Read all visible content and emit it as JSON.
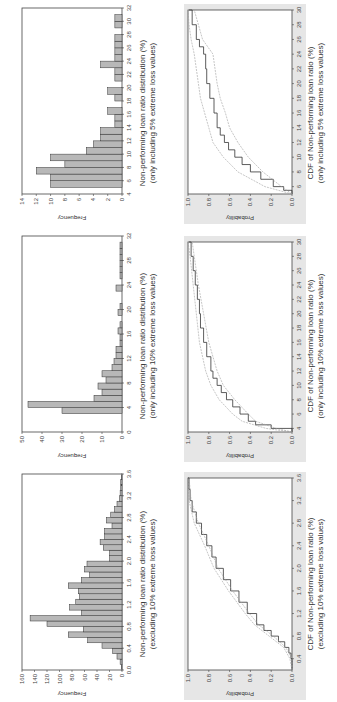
{
  "figure": {
    "orientation": "rotated 90 degrees counter-clockwise",
    "colors": {
      "bar_fill": "#b8b8b8",
      "bar_stroke": "#333333",
      "cdf_bg": "#e6e6e6",
      "cdf_line": "#333333",
      "cdf_band": "#a0a0a0"
    }
  },
  "panels": {
    "hist_excl10": {
      "ylabel": "Frequency",
      "caption_line1": "Non-performing loan ratio distribution (%)",
      "caption_line2": "(excluding 10% extreme loss values)"
    },
    "hist_only10": {
      "ylabel": "Frequency",
      "caption_line1": "Non-performing loan ratio distribution (%)",
      "caption_line2": "(only including 10% extreme loss values)"
    },
    "hist_only5": {
      "ylabel": "Frequency",
      "caption_line1": "Non-performing loan ratio distribution (%)",
      "caption_line2": "(only including 5% extreme loss values)"
    },
    "cdf_excl10": {
      "ylabel": "Probability",
      "caption_line1": "CDF of Non-performing loan ratio (%)",
      "caption_line2": "(excluding 10% extreme loss values)"
    },
    "cdf_only10": {
      "ylabel": "Probability",
      "caption_line1": "CDF of Non-performing loan ratio (%)",
      "caption_line2": "(only including 10% extreme loss values)"
    },
    "cdf_only5": {
      "ylabel": "Probability",
      "caption_line1": "CDF of Non-performing loan ratio (%)",
      "caption_line2": "(only including 5% extreme loss values)"
    }
  },
  "chart_data": [
    {
      "id": "hist_excl10",
      "type": "bar",
      "title": "Non-performing loan ratio distribution (%) (excluding 10% extreme loss values)",
      "xlabel": "Non-performing loan ratio (%)",
      "ylabel": "Frequency",
      "xlim": [
        0.0,
        3.6
      ],
      "ylim": [
        0,
        160
      ],
      "xticks": [
        0.0,
        0.4,
        0.8,
        1.2,
        1.6,
        2.0,
        2.4,
        2.8,
        3.2,
        3.6
      ],
      "yticks": [
        0,
        20,
        40,
        60,
        80,
        100,
        120,
        140,
        160
      ],
      "bin_width": 0.1,
      "bin_start": 0.0,
      "values": [
        1,
        3,
        8,
        15,
        32,
        55,
        86,
        62,
        120,
        147,
        65,
        84,
        74,
        68,
        70,
        86,
        65,
        52,
        60,
        56,
        20,
        20,
        30,
        35,
        28,
        28,
        16,
        25,
        18,
        12,
        8,
        4,
        3,
        2,
        2,
        1
      ],
      "grid": false
    },
    {
      "id": "hist_only10",
      "type": "bar",
      "title": "Non-performing loan ratio distribution (%) (only including 10% extreme loss values)",
      "xlabel": "Non-performing loan ratio (%)",
      "ylabel": "Frequency",
      "xlim": [
        0,
        32
      ],
      "ylim": [
        0,
        50
      ],
      "xticks": [
        0,
        4,
        8,
        12,
        16,
        20,
        24,
        28,
        32
      ],
      "yticks": [
        0,
        10,
        20,
        30,
        40,
        50
      ],
      "bin_width": 1,
      "bin_start": 3,
      "values": [
        30,
        47,
        14,
        10,
        12,
        8,
        10,
        5,
        4,
        3,
        3,
        1,
        1,
        2,
        1,
        0,
        2,
        1,
        0,
        0,
        3,
        0,
        1,
        1,
        1,
        1,
        1,
        1
      ],
      "grid": false
    },
    {
      "id": "hist_only5",
      "type": "bar",
      "title": "Non-performing loan ratio distribution (%) (only including 5% extreme loss values)",
      "xlabel": "Non-performing loan ratio (%)",
      "ylabel": "Frequency",
      "xlim": [
        4,
        32
      ],
      "ylim": [
        0,
        14
      ],
      "xticks": [
        4,
        6,
        8,
        10,
        12,
        14,
        16,
        18,
        20,
        22,
        24,
        26,
        28,
        30,
        32
      ],
      "yticks": [
        0,
        2,
        4,
        6,
        8,
        10,
        12,
        14
      ],
      "bin_width": 1,
      "bin_start": 5,
      "values": [
        10,
        10,
        12,
        8,
        10,
        5,
        4,
        3,
        3,
        1,
        1,
        2,
        0,
        1,
        2,
        0,
        1,
        1,
        3,
        1,
        1,
        1,
        1,
        0,
        1,
        1
      ],
      "grid": false
    },
    {
      "id": "cdf_excl10",
      "type": "line",
      "title": "CDF of Non-performing loan ratio (%) (excluding 10% extreme loss values)",
      "xlabel": "Non-performing loan ratio (%)",
      "ylabel": "Probability",
      "xlim": [
        0.2,
        3.6
      ],
      "ylim": [
        0.0,
        1.0
      ],
      "xticks": [
        0.4,
        0.8,
        1.2,
        1.6,
        2.0,
        2.4,
        2.8,
        3.2,
        3.6
      ],
      "yticks": [
        0.0,
        0.2,
        0.4,
        0.6,
        0.8,
        1.0
      ],
      "series": [
        {
          "name": "Empirical CDF",
          "x": [
            0.2,
            0.4,
            0.5,
            0.6,
            0.7,
            0.8,
            0.9,
            1.0,
            1.2,
            1.4,
            1.6,
            1.8,
            2.0,
            2.2,
            2.4,
            2.6,
            2.8,
            3.0,
            3.2,
            3.4,
            3.6
          ],
          "values": [
            0.0,
            0.01,
            0.03,
            0.07,
            0.13,
            0.2,
            0.27,
            0.34,
            0.43,
            0.51,
            0.59,
            0.66,
            0.73,
            0.77,
            0.82,
            0.87,
            0.92,
            0.96,
            0.98,
            0.99,
            1.0
          ]
        },
        {
          "name": "Lower bound",
          "x": [
            0.2,
            0.4,
            0.6,
            0.8,
            1.0,
            1.2,
            1.6,
            2.0,
            2.4,
            2.8,
            3.2,
            3.6
          ],
          "values": [
            0.0,
            0.0,
            0.06,
            0.18,
            0.32,
            0.41,
            0.57,
            0.71,
            0.8,
            0.9,
            0.97,
            0.99
          ]
        },
        {
          "name": "Upper bound",
          "x": [
            0.2,
            0.4,
            0.6,
            0.8,
            1.0,
            1.2,
            1.6,
            2.0,
            2.4,
            2.8,
            3.2,
            3.6
          ],
          "values": [
            0.0,
            0.02,
            0.08,
            0.22,
            0.36,
            0.45,
            0.61,
            0.75,
            0.84,
            0.94,
            0.99,
            1.0
          ]
        }
      ],
      "grid": false
    },
    {
      "id": "cdf_only10",
      "type": "line",
      "title": "CDF of Non-performing loan ratio (%) (only including 10% extreme loss values)",
      "xlabel": "Non-performing loan ratio (%)",
      "ylabel": "Probability",
      "xlim": [
        3.5,
        30
      ],
      "ylim": [
        0.0,
        1.0
      ],
      "xticks": [
        4,
        6,
        8,
        10,
        12,
        14,
        16,
        18,
        20,
        22,
        24,
        26,
        28,
        30
      ],
      "yticks": [
        0.0,
        0.2,
        0.4,
        0.6,
        0.8,
        1.0
      ],
      "series": [
        {
          "name": "Empirical CDF",
          "x": [
            3.5,
            4,
            4.5,
            5,
            6,
            7,
            8,
            9,
            10,
            11,
            12,
            14,
            16,
            18,
            20,
            22,
            24,
            26,
            28,
            30
          ],
          "values": [
            0.0,
            0.2,
            0.35,
            0.42,
            0.5,
            0.57,
            0.63,
            0.68,
            0.72,
            0.76,
            0.78,
            0.82,
            0.85,
            0.88,
            0.89,
            0.91,
            0.93,
            0.95,
            0.97,
            0.99
          ]
        },
        {
          "name": "Lower bound",
          "x": [
            3.5,
            4,
            5,
            6,
            8,
            10,
            12,
            16,
            20,
            24,
            28,
            30
          ],
          "values": [
            0.0,
            0.15,
            0.35,
            0.42,
            0.55,
            0.66,
            0.72,
            0.8,
            0.85,
            0.9,
            0.94,
            0.96
          ]
        },
        {
          "name": "Upper bound",
          "x": [
            3.5,
            4,
            5,
            6,
            8,
            10,
            12,
            16,
            20,
            24,
            28,
            30
          ],
          "values": [
            0.0,
            0.25,
            0.48,
            0.57,
            0.7,
            0.78,
            0.83,
            0.89,
            0.92,
            0.95,
            0.98,
            1.0
          ]
        }
      ],
      "grid": false
    },
    {
      "id": "cdf_only5",
      "type": "line",
      "title": "CDF of Non-performing loan ratio (%) (only including 5% extreme loss values)",
      "xlabel": "Non-performing loan ratio (%)",
      "ylabel": "Probability",
      "xlim": [
        5,
        30
      ],
      "ylim": [
        0.0,
        1.0
      ],
      "xticks": [
        6,
        8,
        10,
        12,
        14,
        16,
        18,
        20,
        22,
        24,
        26,
        28,
        30
      ],
      "yticks": [
        0.0,
        0.2,
        0.4,
        0.6,
        0.8,
        1.0
      ],
      "series": [
        {
          "name": "Empirical CDF",
          "x": [
            5,
            5.5,
            6,
            7,
            8,
            9,
            10,
            11,
            12,
            13,
            14,
            16,
            18,
            20,
            22,
            24,
            25,
            26,
            28,
            30
          ],
          "values": [
            0.0,
            0.08,
            0.18,
            0.3,
            0.4,
            0.48,
            0.55,
            0.61,
            0.65,
            0.69,
            0.72,
            0.75,
            0.79,
            0.82,
            0.83,
            0.85,
            0.89,
            0.92,
            0.96,
            0.99
          ]
        },
        {
          "name": "Lower bound",
          "x": [
            5,
            6,
            8,
            10,
            12,
            14,
            16,
            18,
            20,
            22,
            24,
            26,
            28,
            30
          ],
          "values": [
            0.0,
            0.1,
            0.28,
            0.42,
            0.52,
            0.6,
            0.64,
            0.69,
            0.72,
            0.74,
            0.76,
            0.86,
            0.9,
            0.94
          ]
        },
        {
          "name": "Upper bound",
          "x": [
            5,
            6,
            8,
            10,
            12,
            14,
            16,
            18,
            20,
            22,
            24,
            26,
            28,
            30
          ],
          "values": [
            0.0,
            0.26,
            0.52,
            0.66,
            0.76,
            0.8,
            0.84,
            0.88,
            0.9,
            0.92,
            0.94,
            0.97,
            0.99,
            1.0
          ]
        }
      ],
      "grid": false
    }
  ]
}
